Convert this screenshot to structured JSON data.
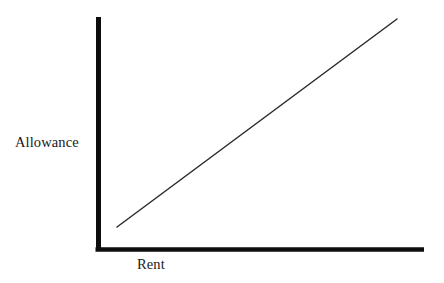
{
  "figure": {
    "background_color": "#ffffff",
    "ink_color": "#111111",
    "line_color": "#2b2b2b"
  },
  "axes": {
    "y_label": "Allowance",
    "x_label": "Rent",
    "axis_color": "#0d0d0d",
    "axis_thickness_px": 5,
    "y_axis_top_y": 17,
    "y_axis_x": 98,
    "x_axis_y": 249,
    "x_axis_right_x": 424
  },
  "chart_data": {
    "type": "line",
    "title": "",
    "subtitle": "",
    "xlabel": "Rent",
    "ylabel": "Allowance",
    "xlim": [
      0,
      100
    ],
    "ylim": [
      0,
      100
    ],
    "grid": false,
    "legend": null,
    "axis_ticks": {
      "x": [],
      "y": []
    },
    "annotations": [],
    "series": [
      {
        "name": "Allowance as a function of Rent",
        "relationship": "positive linear",
        "x": [
          6,
          100
        ],
        "y": [
          10,
          100
        ],
        "pixel_start": [
          117,
          227
        ],
        "pixel_end": [
          397,
          19
        ]
      }
    ]
  }
}
